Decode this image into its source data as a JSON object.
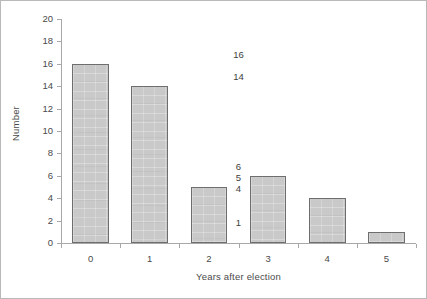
{
  "chart_data": {
    "type": "bar",
    "title": "",
    "xlabel": "Years after election",
    "ylabel": "Number",
    "categories": [
      "0",
      "1",
      "2",
      "3",
      "4",
      "5"
    ],
    "values": [
      16,
      14,
      5,
      6,
      4,
      1
    ],
    "value_labels": [
      "16",
      "14",
      "5",
      "6",
      "4",
      "1"
    ],
    "ylim": [
      0,
      20
    ],
    "ytick_values": [
      0,
      2,
      4,
      6,
      8,
      10,
      12,
      14,
      16,
      18,
      20
    ],
    "ytick_labels": [
      "0",
      "2",
      "4",
      "6",
      "8",
      "10",
      "12",
      "14",
      "16",
      "18",
      "20"
    ],
    "grid": false,
    "legend": false,
    "legend_position": "none",
    "bar_fill_color": "#c9c9c9",
    "bar_border_color": "#6e6e6e",
    "axis_color": "#a8a8a8",
    "text_color": "#4a4a4a"
  }
}
